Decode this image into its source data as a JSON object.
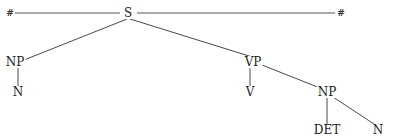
{
  "diagram": {
    "type": "syntax-tree",
    "boundary_symbols": {
      "left": "#",
      "right": "#"
    },
    "nodes": [
      {
        "id": "S",
        "label": "S",
        "x": 128,
        "y": 13
      },
      {
        "id": "NP1",
        "label": "NP",
        "x": 15,
        "y": 62
      },
      {
        "id": "N1",
        "label": "N",
        "x": 18,
        "y": 92
      },
      {
        "id": "VP",
        "label": "VP",
        "x": 253,
        "y": 62
      },
      {
        "id": "V",
        "label": "V",
        "x": 253,
        "y": 92
      },
      {
        "id": "NP2",
        "label": "NP",
        "x": 327,
        "y": 92
      },
      {
        "id": "DET",
        "label": "DET",
        "x": 327,
        "y": 130
      },
      {
        "id": "N2",
        "label": "N",
        "x": 378,
        "y": 130
      }
    ],
    "edges": [
      {
        "from": "S",
        "to": "NP1"
      },
      {
        "from": "S",
        "to": "VP"
      },
      {
        "from": "NP1",
        "to": "N1"
      },
      {
        "from": "VP",
        "to": "V"
      },
      {
        "from": "VP",
        "to": "NP2"
      },
      {
        "from": "NP2",
        "to": "DET"
      },
      {
        "from": "NP2",
        "to": "N2"
      }
    ],
    "colors": {
      "line": "#4a4a4a",
      "text": "#222222",
      "background": "#ffffff"
    }
  }
}
